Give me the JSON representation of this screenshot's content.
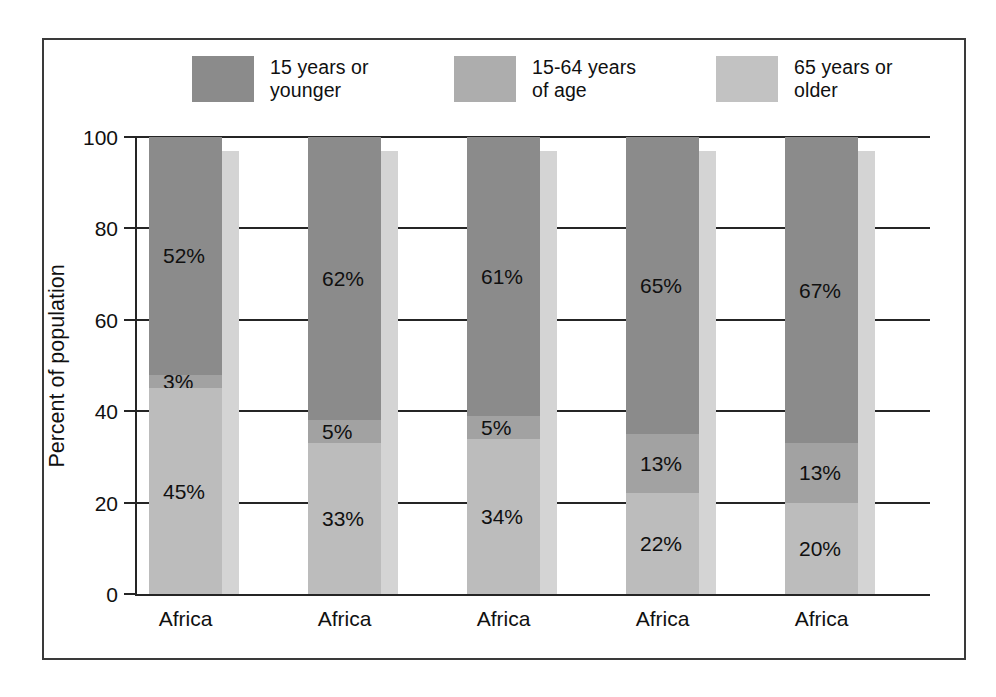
{
  "chart_data": {
    "type": "bar",
    "subtype": "stacked-column-100",
    "title": "",
    "xlabel": "",
    "ylabel": "Percent of population",
    "ylim": [
      0,
      100
    ],
    "yticks": [
      0,
      20,
      40,
      60,
      80,
      100
    ],
    "ytick_labels": [
      "0",
      "20",
      "40",
      "60",
      "80",
      "100"
    ],
    "grid": true,
    "legend_position": "top",
    "categories": [
      "Africa",
      "Africa",
      "Africa",
      "Africa",
      "Africa"
    ],
    "series": [
      {
        "name": "15 years or younger",
        "color": "#8b8b8b",
        "values": [
          52,
          62,
          61,
          65,
          67
        ],
        "value_labels": [
          "52%",
          "62%",
          "61%",
          "65%",
          "67%"
        ]
      },
      {
        "name": "65 years or older",
        "color": "#a2a2a2",
        "values": [
          3,
          5,
          5,
          13,
          13
        ],
        "value_labels": [
          "3%",
          "5%",
          "5%",
          "13%",
          "13%"
        ]
      },
      {
        "name": "15-64 years of age",
        "color": "#bcbcbc",
        "values": [
          45,
          33,
          34,
          22,
          20
        ],
        "value_labels": [
          "45%",
          "33%",
          "34%",
          "22%",
          "20%"
        ]
      }
    ],
    "stack_order_top_to_bottom": [
      "15 years or younger",
      "65 years or older",
      "15-64 years of age"
    ]
  },
  "legend": {
    "items": [
      {
        "label": "15 years or\nyounger",
        "swatch_color": "#8b8b8b",
        "swatch_name": "legend-swatch-15-or-younger"
      },
      {
        "label": "15-64 years\nof age",
        "swatch_color": "#adadad",
        "swatch_name": "legend-swatch-15-64-years"
      },
      {
        "label": "65 years or\nolder",
        "swatch_color": "#c2c2c2",
        "swatch_name": "legend-swatch-65-or-older"
      }
    ]
  },
  "axis": {
    "y_title": "Percent of population",
    "y_tick_labels": [
      "100",
      "80",
      "60",
      "40",
      "20",
      "0"
    ]
  },
  "bars": [
    {
      "category": "Africa",
      "segments": [
        {
          "label": "52%",
          "value": 52,
          "color": "#8b8b8b",
          "series": "15 years or younger"
        },
        {
          "label": "3%",
          "value": 3,
          "color": "#a2a2a2",
          "series": "65 years or older"
        },
        {
          "label": "45%",
          "value": 45,
          "color": "#bcbcbc",
          "series": "15-64 years of age"
        }
      ]
    },
    {
      "category": "Africa",
      "segments": [
        {
          "label": "62%",
          "value": 62,
          "color": "#8b8b8b",
          "series": "15 years or younger"
        },
        {
          "label": "5%",
          "value": 5,
          "color": "#a2a2a2",
          "series": "65 years or older"
        },
        {
          "label": "33%",
          "value": 33,
          "color": "#bcbcbc",
          "series": "15-64 years of age"
        }
      ]
    },
    {
      "category": "Africa",
      "segments": [
        {
          "label": "61%",
          "value": 61,
          "color": "#8b8b8b",
          "series": "15 years or younger"
        },
        {
          "label": "5%",
          "value": 5,
          "color": "#a2a2a2",
          "series": "65 years or older"
        },
        {
          "label": "34%",
          "value": 34,
          "color": "#bcbcbc",
          "series": "15-64 years of age"
        }
      ]
    },
    {
      "category": "Africa",
      "segments": [
        {
          "label": "65%",
          "value": 65,
          "color": "#8b8b8b",
          "series": "15 years or younger"
        },
        {
          "label": "13%",
          "value": 13,
          "color": "#a2a2a2",
          "series": "65 years or older"
        },
        {
          "label": "22%",
          "value": 22,
          "color": "#bcbcbc",
          "series": "15-64 years of age"
        }
      ]
    },
    {
      "category": "Africa",
      "segments": [
        {
          "label": "67%",
          "value": 67,
          "color": "#8b8b8b",
          "series": "15 years or younger"
        },
        {
          "label": "13%",
          "value": 13,
          "color": "#a2a2a2",
          "series": "65 years or older"
        },
        {
          "label": "20%",
          "value": 20,
          "color": "#bcbcbc",
          "series": "15-64 years of age"
        }
      ]
    }
  ],
  "style": {
    "frame_border_color": "#3a3a3a",
    "axis_color": "#252525",
    "shadow_color": "#d4d4d4",
    "background": "#ffffff"
  }
}
